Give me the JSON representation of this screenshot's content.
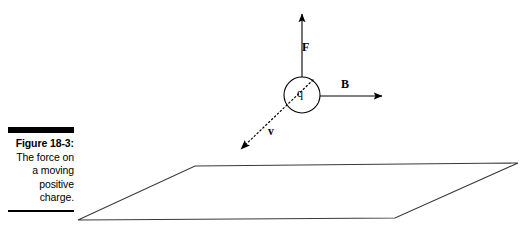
{
  "figure": {
    "caption": {
      "title": "Figure 18-3:",
      "lines": [
        "The force on",
        "a moving",
        "positive",
        "charge."
      ]
    },
    "labels": {
      "force": "F",
      "magnetic_field": "B",
      "velocity": "v",
      "charge": "q"
    },
    "colors": {
      "ink": "#000000",
      "plane_stroke": "#3a3a3a",
      "background": "#ffffff"
    },
    "geometry": {
      "charge_circle": {
        "cx": 302,
        "cy": 95,
        "r": 18
      },
      "force_arrow": {
        "x1": 302,
        "y1": 77,
        "x2": 302,
        "y2": 12
      },
      "field_arrow": {
        "x1": 320,
        "y1": 96,
        "x2": 385,
        "y2": 96
      },
      "velocity_arrow": {
        "x1": 312,
        "y1": 80,
        "x2": 238,
        "y2": 151,
        "style": "dotted"
      },
      "plane": {
        "top_left": [
          195,
          166
        ],
        "top_right": [
          518,
          163
        ],
        "bottom_right": [
          395,
          218
        ],
        "bottom_left": [
          78,
          220
        ]
      }
    }
  }
}
